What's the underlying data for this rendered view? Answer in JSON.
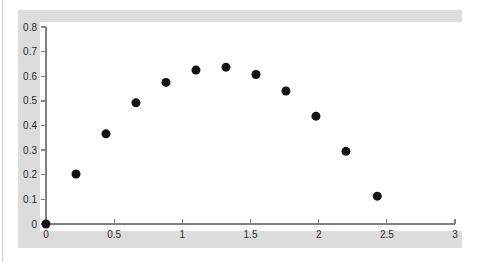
{
  "figure": {
    "background_color": "#ffffff",
    "frame_color": "#dcdcdc",
    "canvas_color": "#ffffff",
    "axis_color": "#808080",
    "point_color": "#141414"
  },
  "chart_data": {
    "type": "scatter",
    "title": "",
    "subtitle": "",
    "xlabel": "",
    "ylabel": "",
    "xlim": [
      0,
      3
    ],
    "ylim": [
      0,
      0.8
    ],
    "grid": false,
    "legend": null,
    "legend_position": "none",
    "marker": "filled-circle",
    "marker_size_px": 9,
    "xticks": [
      0,
      0.5,
      1,
      1.5,
      2,
      2.5,
      3
    ],
    "xtick_labels": [
      "0",
      "0.5",
      "1",
      "1.5",
      "2",
      "2.5",
      "3"
    ],
    "yticks": [
      0,
      0.1,
      0.2,
      0.3,
      0.4,
      0.5,
      0.6,
      0.7,
      0.8
    ],
    "ytick_labels": [
      "0",
      "0.1",
      "0.2",
      "0.3",
      "0.4",
      "0.5",
      "0.6",
      "0.7",
      "0.8"
    ],
    "x": [
      0,
      0.22,
      0.44,
      0.66,
      0.88,
      1.1,
      1.32,
      1.54,
      1.76,
      1.98,
      2.2,
      2.43
    ],
    "y": [
      0,
      0.203,
      0.366,
      0.492,
      0.575,
      0.625,
      0.637,
      0.607,
      0.54,
      0.438,
      0.295,
      0.113
    ],
    "points": [
      {
        "x": 0,
        "y": 0
      },
      {
        "x": 0.22,
        "y": 0.203
      },
      {
        "x": 0.44,
        "y": 0.366
      },
      {
        "x": 0.66,
        "y": 0.492
      },
      {
        "x": 0.88,
        "y": 0.575
      },
      {
        "x": 1.1,
        "y": 0.625
      },
      {
        "x": 1.32,
        "y": 0.637
      },
      {
        "x": 1.54,
        "y": 0.607
      },
      {
        "x": 1.76,
        "y": 0.54
      },
      {
        "x": 1.98,
        "y": 0.438
      },
      {
        "x": 2.2,
        "y": 0.295
      },
      {
        "x": 2.43,
        "y": 0.113
      }
    ]
  }
}
